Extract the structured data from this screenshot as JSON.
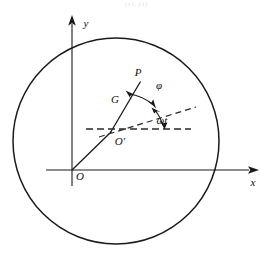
{
  "figure": {
    "caption_faint": "(x1, y1)",
    "background_color": "#ffffff",
    "line_color": "#1a1a1a",
    "dash_color": "#2a2a2a",
    "width": 273,
    "height": 262
  },
  "axes": {
    "x_label": "x",
    "y_label": "y",
    "origin_label": "O"
  },
  "points": {
    "center_label": "O'",
    "tip_label": "P",
    "mid_label": "G"
  },
  "angles": {
    "phi_label": "φ",
    "omega_t_label": "ωt"
  },
  "geometry": {
    "circle": {
      "cx": 116,
      "cy": 141,
      "r": 103
    },
    "origin": {
      "x": 72,
      "y": 170
    },
    "o_prime": {
      "x": 111,
      "y": 131
    },
    "p_point": {
      "x": 141,
      "y": 81
    },
    "x_axis_end": {
      "x": 258,
      "y": 170
    },
    "y_axis_end": {
      "x": 72,
      "y": 18
    },
    "dashed_horizontal_start": {
      "x": 86,
      "y": 129
    },
    "dashed_horizontal_end": {
      "x": 191,
      "y": 129
    },
    "dashed_incline_end": {
      "x": 195,
      "y": 108
    }
  }
}
